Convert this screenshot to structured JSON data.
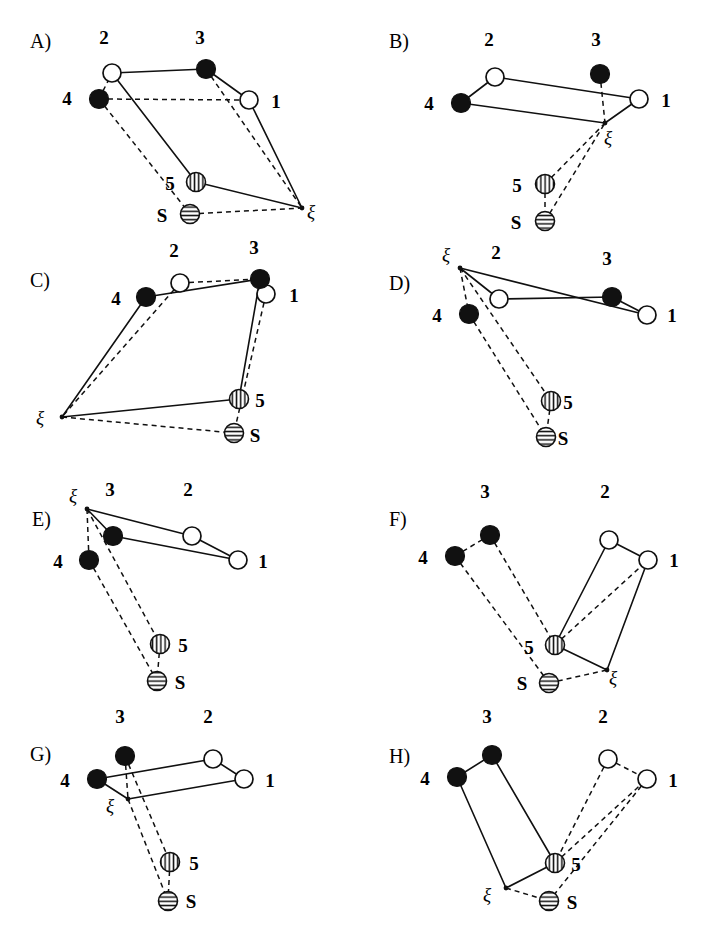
{
  "figure": {
    "width": 718,
    "height": 949,
    "background": "#ffffff",
    "ink_color": "#101010",
    "columns": 2,
    "rows": 4
  },
  "node_styles": {
    "open": {
      "name": "open-circle",
      "fill": "#ffffff",
      "stroke": "#101010",
      "radius": 9
    },
    "filled": {
      "name": "filled-circle",
      "fill": "#111111",
      "stroke": "#111111",
      "radius": 9.5
    },
    "vhatch": {
      "name": "vertical-hatched-circle",
      "fill": "#ffffff",
      "stroke": "#101010",
      "radius": 9.5
    },
    "hhatch": {
      "name": "horizontal-hatched-circle",
      "fill": "#ffffff",
      "stroke": "#101010",
      "radius": 9.5
    },
    "vertex": {
      "name": "xi-vertex-dot",
      "fill": "#101010",
      "radius": 2.4
    }
  },
  "legend_symbols": {
    "node_1": "open",
    "node_2": "open",
    "node_3": "filled",
    "node_4": "filled",
    "node_5": "vhatch",
    "node_S": "hhatch",
    "xi": "vertex"
  },
  "panels": [
    {
      "id": "A",
      "letter": "A)",
      "letter_pos": [
        30,
        48
      ],
      "origin": [
        0,
        0
      ],
      "nodes": [
        {
          "id": "1",
          "label": "1",
          "style": "open",
          "x": 249,
          "y": 100,
          "label_pos": [
            276,
            108
          ]
        },
        {
          "id": "2",
          "label": "2",
          "style": "open",
          "x": 112,
          "y": 73,
          "label_pos": [
            104,
            44
          ]
        },
        {
          "id": "3",
          "label": "3",
          "style": "filled",
          "x": 206,
          "y": 69,
          "label_pos": [
            200,
            44
          ]
        },
        {
          "id": "4",
          "label": "4",
          "style": "filled",
          "x": 99,
          "y": 99,
          "label_pos": [
            67,
            105
          ]
        },
        {
          "id": "5",
          "label": "5",
          "style": "vhatch",
          "x": 196,
          "y": 182,
          "label_pos": [
            170,
            190
          ]
        },
        {
          "id": "S",
          "label": "S",
          "style": "hhatch",
          "x": 190,
          "y": 214,
          "label_pos": [
            162,
            222
          ]
        }
      ],
      "xi": {
        "x": 302,
        "y": 208,
        "label": "ξ",
        "label_pos": [
          311,
          218
        ]
      },
      "solid_edges": [
        [
          "2",
          "3"
        ],
        [
          "3",
          "1"
        ],
        [
          "2",
          "5"
        ],
        [
          "5",
          "xi"
        ],
        [
          "1",
          "xi"
        ]
      ],
      "dashed_edges": [
        [
          "4",
          "2"
        ],
        [
          "4",
          "1"
        ],
        [
          "3",
          "xi"
        ],
        [
          "4",
          "S"
        ],
        [
          "S",
          "xi"
        ]
      ]
    },
    {
      "id": "B",
      "letter": "B)",
      "letter_pos": [
        30,
        48
      ],
      "origin": [
        359,
        0
      ],
      "nodes": [
        {
          "id": "1",
          "label": "1",
          "style": "open",
          "x": 280,
          "y": 99,
          "label_pos": [
            307,
            107
          ]
        },
        {
          "id": "2",
          "label": "2",
          "style": "open",
          "x": 136,
          "y": 77,
          "label_pos": [
            130,
            46
          ]
        },
        {
          "id": "3",
          "label": "3",
          "style": "filled",
          "x": 241,
          "y": 74,
          "label_pos": [
            237,
            46
          ]
        },
        {
          "id": "4",
          "label": "4",
          "style": "filled",
          "x": 102,
          "y": 103,
          "label_pos": [
            70,
            110
          ]
        },
        {
          "id": "5",
          "label": "5",
          "style": "vhatch",
          "x": 186,
          "y": 184,
          "label_pos": [
            158,
            192
          ]
        },
        {
          "id": "S",
          "label": "S",
          "style": "hhatch",
          "x": 186,
          "y": 221,
          "label_pos": [
            157,
            229
          ]
        }
      ],
      "xi": {
        "x": 246,
        "y": 123,
        "label": "ξ",
        "label_pos": [
          249,
          144
        ]
      },
      "solid_edges": [
        [
          "4",
          "2"
        ],
        [
          "2",
          "1"
        ],
        [
          "4",
          "xi"
        ],
        [
          "xi",
          "1"
        ]
      ],
      "dashed_edges": [
        [
          "3",
          "xi"
        ],
        [
          "5",
          "xi"
        ],
        [
          "S",
          "xi"
        ],
        [
          "5",
          "S"
        ]
      ]
    },
    {
      "id": "C",
      "letter": "C)",
      "letter_pos": [
        30,
        50
      ],
      "origin": [
        0,
        237
      ],
      "nodes": [
        {
          "id": "1",
          "label": "1",
          "style": "open",
          "x": 266,
          "y": 57,
          "label_pos": [
            294,
            65
          ]
        },
        {
          "id": "2",
          "label": "2",
          "style": "open",
          "x": 180,
          "y": 46,
          "label_pos": [
            174,
            20
          ]
        },
        {
          "id": "3",
          "label": "3",
          "style": "filled",
          "x": 260,
          "y": 42,
          "label_pos": [
            254,
            17
          ]
        },
        {
          "id": "4",
          "label": "4",
          "style": "filled",
          "x": 146,
          "y": 60,
          "label_pos": [
            116,
            68
          ]
        },
        {
          "id": "5",
          "label": "5",
          "style": "vhatch",
          "x": 239,
          "y": 162,
          "label_pos": [
            260,
            170
          ]
        },
        {
          "id": "S",
          "label": "S",
          "style": "hhatch",
          "x": 234,
          "y": 196,
          "label_pos": [
            255,
            205
          ]
        }
      ],
      "xi": {
        "x": 62,
        "y": 180,
        "label": "ξ",
        "label_pos": [
          40,
          187
        ]
      },
      "solid_edges": [
        [
          "4",
          "3"
        ],
        [
          "4",
          "xi"
        ],
        [
          "3",
          "5"
        ],
        [
          "xi",
          "5"
        ]
      ],
      "dashed_edges": [
        [
          "2",
          "3"
        ],
        [
          "2",
          "xi"
        ],
        [
          "3",
          "1"
        ],
        [
          "1",
          "S"
        ],
        [
          "xi",
          "S"
        ]
      ]
    },
    {
      "id": "D",
      "letter": "D)",
      "letter_pos": [
        30,
        53
      ],
      "origin": [
        359,
        237
      ],
      "nodes": [
        {
          "id": "1",
          "label": "1",
          "style": "open",
          "x": 288,
          "y": 78,
          "label_pos": [
            313,
            85
          ]
        },
        {
          "id": "2",
          "label": "2",
          "style": "open",
          "x": 140,
          "y": 62,
          "label_pos": [
            137,
            22
          ]
        },
        {
          "id": "3",
          "label": "3",
          "style": "filled",
          "x": 253,
          "y": 60,
          "label_pos": [
            248,
            28
          ]
        },
        {
          "id": "4",
          "label": "4",
          "style": "filled",
          "x": 110,
          "y": 77,
          "label_pos": [
            78,
            85
          ]
        },
        {
          "id": "5",
          "label": "5",
          "style": "vhatch",
          "x": 192,
          "y": 164,
          "label_pos": [
            209,
            172
          ]
        },
        {
          "id": "S",
          "label": "S",
          "style": "hhatch",
          "x": 187,
          "y": 200,
          "label_pos": [
            204,
            208
          ]
        }
      ],
      "xi": {
        "x": 101,
        "y": 31,
        "label": "ξ",
        "label_pos": [
          87,
          24
        ]
      },
      "solid_edges": [
        [
          "xi",
          "2"
        ],
        [
          "2",
          "3"
        ],
        [
          "3",
          "1"
        ],
        [
          "xi",
          "1"
        ]
      ],
      "dashed_edges": [
        [
          "xi",
          "4"
        ],
        [
          "xi",
          "5"
        ],
        [
          "4",
          "S"
        ],
        [
          "5",
          "S"
        ]
      ]
    },
    {
      "id": "E",
      "letter": "E)",
      "letter_pos": [
        32,
        52
      ],
      "origin": [
        0,
        474
      ],
      "nodes": [
        {
          "id": "1",
          "label": "1",
          "style": "open",
          "x": 238,
          "y": 86,
          "label_pos": [
            263,
            94
          ]
        },
        {
          "id": "2",
          "label": "2",
          "style": "open",
          "x": 192,
          "y": 62,
          "label_pos": [
            188,
            22
          ]
        },
        {
          "id": "3",
          "label": "3",
          "style": "filled",
          "x": 113,
          "y": 62,
          "label_pos": [
            110,
            22
          ]
        },
        {
          "id": "4",
          "label": "4",
          "style": "filled",
          "x": 89,
          "y": 86,
          "label_pos": [
            58,
            94
          ]
        },
        {
          "id": "5",
          "label": "5",
          "style": "vhatch",
          "x": 160,
          "y": 170,
          "label_pos": [
            183,
            178
          ]
        },
        {
          "id": "S",
          "label": "S",
          "style": "hhatch",
          "x": 157,
          "y": 207,
          "label_pos": [
            180,
            215
          ]
        }
      ],
      "xi": {
        "x": 87,
        "y": 35,
        "label": "ξ",
        "label_pos": [
          73,
          28
        ]
      },
      "solid_edges": [
        [
          "xi",
          "2"
        ],
        [
          "2",
          "1"
        ],
        [
          "xi",
          "3"
        ],
        [
          "3",
          "1"
        ]
      ],
      "dashed_edges": [
        [
          "xi",
          "4"
        ],
        [
          "xi",
          "5"
        ],
        [
          "4",
          "S"
        ],
        [
          "5",
          "S"
        ]
      ]
    },
    {
      "id": "F",
      "letter": "F)",
      "letter_pos": [
        30,
        52
      ],
      "origin": [
        359,
        474
      ],
      "nodes": [
        {
          "id": "1",
          "label": "1",
          "style": "open",
          "x": 289,
          "y": 86,
          "label_pos": [
            315,
            93
          ]
        },
        {
          "id": "2",
          "label": "2",
          "style": "open",
          "x": 250,
          "y": 66,
          "label_pos": [
            246,
            24
          ]
        },
        {
          "id": "3",
          "label": "3",
          "style": "filled",
          "x": 131,
          "y": 61,
          "label_pos": [
            126,
            24
          ]
        },
        {
          "id": "4",
          "label": "4",
          "style": "filled",
          "x": 96,
          "y": 82,
          "label_pos": [
            64,
            90
          ]
        },
        {
          "id": "5",
          "label": "5",
          "style": "vhatch",
          "x": 196,
          "y": 171,
          "label_pos": [
            170,
            180
          ]
        },
        {
          "id": "S",
          "label": "S",
          "style": "hhatch",
          "x": 190,
          "y": 209,
          "label_pos": [
            163,
            216
          ]
        }
      ],
      "xi": {
        "x": 248,
        "y": 196,
        "label": "ξ",
        "label_pos": [
          254,
          210
        ]
      },
      "solid_edges": [
        [
          "2",
          "1"
        ],
        [
          "2",
          "5"
        ],
        [
          "1",
          "xi"
        ],
        [
          "5",
          "xi"
        ]
      ],
      "dashed_edges": [
        [
          "4",
          "3"
        ],
        [
          "3",
          "5"
        ],
        [
          "4",
          "S"
        ],
        [
          "S",
          "xi"
        ],
        [
          "5",
          "1"
        ]
      ]
    },
    {
      "id": "G",
      "letter": "G)",
      "letter_pos": [
        30,
        50
      ],
      "origin": [
        0,
        711
      ],
      "nodes": [
        {
          "id": "1",
          "label": "1",
          "style": "open",
          "x": 244,
          "y": 68,
          "label_pos": [
            270,
            76
          ]
        },
        {
          "id": "2",
          "label": "2",
          "style": "open",
          "x": 213,
          "y": 48,
          "label_pos": [
            208,
            12
          ]
        },
        {
          "id": "3",
          "label": "3",
          "style": "filled",
          "x": 125,
          "y": 45,
          "label_pos": [
            120,
            12
          ]
        },
        {
          "id": "4",
          "label": "4",
          "style": "filled",
          "x": 97,
          "y": 68,
          "label_pos": [
            65,
            76
          ]
        },
        {
          "id": "5",
          "label": "5",
          "style": "vhatch",
          "x": 170,
          "y": 151,
          "label_pos": [
            194,
            159
          ]
        },
        {
          "id": "S",
          "label": "S",
          "style": "hhatch",
          "x": 168,
          "y": 190,
          "label_pos": [
            191,
            197
          ]
        }
      ],
      "xi": {
        "x": 128,
        "y": 88,
        "label": "ξ",
        "label_pos": [
          110,
          101
        ]
      },
      "solid_edges": [
        [
          "4",
          "2"
        ],
        [
          "2",
          "1"
        ],
        [
          "4",
          "xi"
        ],
        [
          "xi",
          "1"
        ]
      ],
      "dashed_edges": [
        [
          "3",
          "xi"
        ],
        [
          "3",
          "5"
        ],
        [
          "xi",
          "S"
        ],
        [
          "5",
          "S"
        ]
      ]
    },
    {
      "id": "H",
      "letter": "H)",
      "letter_pos": [
        30,
        52
      ],
      "origin": [
        359,
        711
      ],
      "nodes": [
        {
          "id": "1",
          "label": "1",
          "style": "open",
          "x": 288,
          "y": 68,
          "label_pos": [
            314,
            76
          ]
        },
        {
          "id": "2",
          "label": "2",
          "style": "open",
          "x": 249,
          "y": 48,
          "label_pos": [
            244,
            12
          ]
        },
        {
          "id": "3",
          "label": "3",
          "style": "filled",
          "x": 133,
          "y": 44,
          "label_pos": [
            128,
            12
          ]
        },
        {
          "id": "4",
          "label": "4",
          "style": "filled",
          "x": 98,
          "y": 66,
          "label_pos": [
            66,
            74
          ]
        },
        {
          "id": "5",
          "label": "5",
          "style": "vhatch",
          "x": 196,
          "y": 152,
          "label_pos": [
            217,
            160
          ]
        },
        {
          "id": "S",
          "label": "S",
          "style": "hhatch",
          "x": 190,
          "y": 190,
          "label_pos": [
            213,
            198
          ]
        }
      ],
      "xi": {
        "x": 147,
        "y": 177,
        "label": "ξ",
        "label_pos": [
          128,
          190
        ]
      },
      "solid_edges": [
        [
          "4",
          "3"
        ],
        [
          "3",
          "5"
        ],
        [
          "4",
          "xi"
        ],
        [
          "xi",
          "5"
        ]
      ],
      "dashed_edges": [
        [
          "2",
          "1"
        ],
        [
          "2",
          "5"
        ],
        [
          "1",
          "S"
        ],
        [
          "xi",
          "S"
        ],
        [
          "5",
          "1"
        ]
      ]
    }
  ]
}
